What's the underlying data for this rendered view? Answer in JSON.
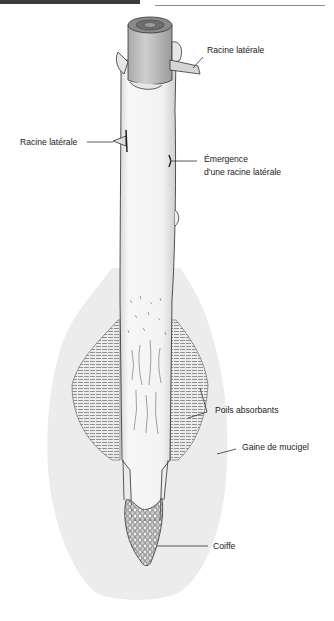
{
  "diagram": {
    "colors": {
      "sheath": "#ececec",
      "root_body": "#f6f6f6",
      "outline": "#2a2a2a",
      "cut_section": "#bdbdbd",
      "text": "#1a1a1a"
    },
    "labels": [
      {
        "id": "lateral-root-top",
        "text": "Racine latérale"
      },
      {
        "id": "lateral-root-left",
        "text": "Racine latérale"
      },
      {
        "id": "emergence-line1",
        "text": "Émergence"
      },
      {
        "id": "emergence-line2",
        "text": "d'une racine latérale"
      },
      {
        "id": "root-hairs",
        "text": "Poils absorbants"
      },
      {
        "id": "mucigel-sheath",
        "text": "Gaine de mucigel"
      },
      {
        "id": "root-cap",
        "text": "Coiffe"
      }
    ]
  }
}
